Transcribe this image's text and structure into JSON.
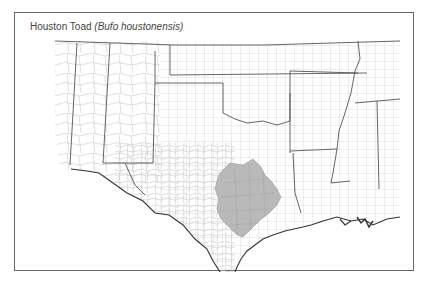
{
  "map": {
    "title": {
      "common_name": "Houston Toad",
      "scientific_name": "(Bufo houstonensis)"
    },
    "region": "South-central United States (county boundaries)",
    "states_shown": [
      "Arizona",
      "New Mexico",
      "Colorado",
      "Kansas",
      "Oklahoma",
      "Texas",
      "Missouri",
      "Arkansas",
      "Louisiana",
      "Mississippi",
      "Alabama",
      "Tennessee"
    ],
    "range": {
      "label": "Houston Toad range",
      "location": "East-central / southeast Texas counties near Houston",
      "fill_color": "#b9b9b9"
    },
    "colors": {
      "frame": "#666666",
      "county_lines": "#bdbdbd",
      "state_lines": "#555555",
      "background": "#ffffff",
      "coast": "#333333"
    }
  }
}
